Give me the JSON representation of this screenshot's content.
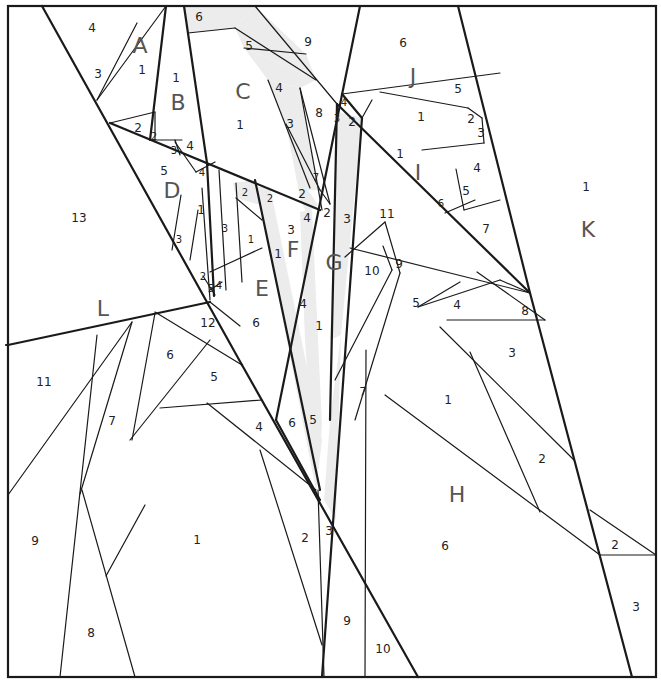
{
  "diagram": {
    "border": {
      "x": 8,
      "y": 6,
      "w": 648,
      "h": 671
    },
    "colors": {
      "line": "#1a1a1a",
      "shade": "#ececec",
      "label": "#222222",
      "section_label": "#555555"
    },
    "shaded_pieces": [
      {
        "id": "C6",
        "points": "184,6 255,6 235,28 188,33"
      },
      {
        "id": "C5",
        "points": "235,28 255,6 306,54 316,80 288,67 244,48"
      },
      {
        "id": "C4",
        "points": "244,48 288,67 316,80 300,88 268,80"
      },
      {
        "id": "C3",
        "points": "268,80 300,88 320,190 308,190 286,124"
      },
      {
        "id": "F2",
        "points": "286,124 308,190 318,205 307,214 300,198"
      },
      {
        "id": "G3",
        "points": "338,112 362,118 341,335 330,340"
      },
      {
        "id": "G4",
        "points": "300,212 312,210 322,425 316,490 305,340"
      },
      {
        "id": "F1",
        "points": "257,187 270,187 322,440 316,490"
      },
      {
        "id": "G3b",
        "points": "330,420 341,335 336,520 324,500"
      },
      {
        "id": "E2",
        "points": "233,183 255,180 264,206 236,198"
      }
    ],
    "bold_lines": [
      [
        42,
        6,
        242,
        365
      ],
      [
        242,
        365,
        418,
        677
      ],
      [
        110,
        123,
        320,
        210
      ],
      [
        184,
        6,
        207,
        163
      ],
      [
        166,
        6,
        150,
        140
      ],
      [
        360,
        6,
        276,
        420
      ],
      [
        276,
        420,
        320,
        500
      ],
      [
        458,
        6,
        530,
        293
      ],
      [
        530,
        293,
        632,
        677
      ],
      [
        337,
        104,
        530,
        293
      ],
      [
        342,
        94,
        362,
        118
      ],
      [
        362,
        118,
        322,
        677
      ],
      [
        337,
        104,
        330,
        420
      ],
      [
        207,
        163,
        214,
        296
      ],
      [
        255,
        180,
        320,
        490
      ],
      [
        8,
        345,
        210,
        302
      ],
      [
        6,
        345,
        8,
        345
      ]
    ],
    "thin_lines": [
      [
        97,
        100,
        166,
        6
      ],
      [
        97,
        100,
        137,
        23
      ],
      [
        110,
        123,
        155,
        112
      ],
      [
        155,
        112,
        155,
        140
      ],
      [
        150,
        140,
        182,
        140
      ],
      [
        175,
        140,
        180,
        155
      ],
      [
        188,
        33,
        235,
        28
      ],
      [
        235,
        28,
        316,
        80
      ],
      [
        244,
        48,
        306,
        54
      ],
      [
        255,
        6,
        337,
        104
      ],
      [
        268,
        80,
        310,
        188
      ],
      [
        286,
        124,
        320,
        190
      ],
      [
        300,
        88,
        330,
        204
      ],
      [
        300,
        88,
        322,
        210
      ],
      [
        320,
        190,
        330,
        204
      ],
      [
        342,
        94,
        500,
        73
      ],
      [
        380,
        92,
        468,
        108
      ],
      [
        468,
        108,
        482,
        118
      ],
      [
        482,
        118,
        484,
        143
      ],
      [
        422,
        150,
        484,
        143
      ],
      [
        362,
        118,
        372,
        100
      ],
      [
        456,
        169,
        464,
        210
      ],
      [
        464,
        210,
        500,
        200
      ],
      [
        445,
        213,
        475,
        200
      ],
      [
        350,
        248,
        530,
        293
      ],
      [
        345,
        257,
        385,
        222
      ],
      [
        392,
        270,
        383,
        246
      ],
      [
        400,
        273,
        385,
        222
      ],
      [
        392,
        270,
        335,
        380
      ],
      [
        400,
        273,
        355,
        420
      ],
      [
        460,
        282,
        418,
        307
      ],
      [
        418,
        307,
        500,
        280
      ],
      [
        500,
        280,
        530,
        293
      ],
      [
        477,
        272,
        545,
        320
      ],
      [
        447,
        320,
        545,
        320
      ],
      [
        440,
        327,
        574,
        460
      ],
      [
        470,
        352,
        540,
        512
      ],
      [
        385,
        395,
        600,
        555
      ],
      [
        590,
        510,
        656,
        555
      ],
      [
        600,
        555,
        656,
        555
      ],
      [
        366,
        350,
        365,
        677
      ],
      [
        202,
        188,
        210,
        300
      ],
      [
        198,
        210,
        190,
        260
      ],
      [
        219,
        170,
        226,
        290
      ],
      [
        236,
        183,
        242,
        282
      ],
      [
        236,
        198,
        262,
        220
      ],
      [
        210,
        272,
        262,
        248
      ],
      [
        203,
        276,
        215,
        295
      ],
      [
        210,
        290,
        222,
        282
      ],
      [
        196,
        172,
        215,
        162
      ],
      [
        175,
        142,
        196,
        172
      ],
      [
        181,
        195,
        172,
        250
      ],
      [
        210,
        302,
        240,
        326
      ],
      [
        155,
        312,
        242,
        365
      ],
      [
        130,
        440,
        210,
        340
      ],
      [
        132,
        322,
        80,
        494
      ],
      [
        8,
        495,
        132,
        322
      ],
      [
        155,
        313,
        132,
        440
      ],
      [
        160,
        408,
        262,
        400
      ],
      [
        207,
        403,
        316,
        490
      ],
      [
        97,
        335,
        60,
        677
      ],
      [
        82,
        490,
        135,
        677
      ],
      [
        106,
        576,
        145,
        505
      ],
      [
        260,
        450,
        322,
        645
      ],
      [
        318,
        490,
        324,
        677
      ]
    ],
    "section_labels": [
      {
        "text": "A",
        "x": 140,
        "y": 45
      },
      {
        "text": "B",
        "x": 178,
        "y": 102
      },
      {
        "text": "C",
        "x": 243,
        "y": 91
      },
      {
        "text": "D",
        "x": 172,
        "y": 190
      },
      {
        "text": "E",
        "x": 262,
        "y": 288
      },
      {
        "text": "F",
        "x": 293,
        "y": 249
      },
      {
        "text": "G",
        "x": 334,
        "y": 262
      },
      {
        "text": "H",
        "x": 457,
        "y": 494
      },
      {
        "text": "I",
        "x": 418,
        "y": 172
      },
      {
        "text": "J",
        "x": 413,
        "y": 76
      },
      {
        "text": "K",
        "x": 588,
        "y": 229
      },
      {
        "text": "L",
        "x": 103,
        "y": 308
      }
    ],
    "piece_numbers": [
      {
        "text": "4",
        "x": 92,
        "y": 28
      },
      {
        "text": "3",
        "x": 98,
        "y": 74
      },
      {
        "text": "1",
        "x": 142,
        "y": 70
      },
      {
        "text": "1",
        "x": 176,
        "y": 78
      },
      {
        "text": "2",
        "x": 138,
        "y": 128
      },
      {
        "text": "2",
        "x": 154,
        "y": 136,
        "small": true
      },
      {
        "text": "3",
        "x": 174,
        "y": 150,
        "small": true
      },
      {
        "text": "4",
        "x": 190,
        "y": 146
      },
      {
        "text": "6",
        "x": 199,
        "y": 17
      },
      {
        "text": "5",
        "x": 249,
        "y": 46
      },
      {
        "text": "9",
        "x": 308,
        "y": 42
      },
      {
        "text": "4",
        "x": 279,
        "y": 88
      },
      {
        "text": "1",
        "x": 240,
        "y": 125
      },
      {
        "text": "3",
        "x": 290,
        "y": 124
      },
      {
        "text": "8",
        "x": 319,
        "y": 113
      },
      {
        "text": "7",
        "x": 316,
        "y": 177,
        "small": true
      },
      {
        "text": "2",
        "x": 302,
        "y": 194
      },
      {
        "text": "4",
        "x": 307,
        "y": 218
      },
      {
        "text": "2",
        "x": 327,
        "y": 213
      },
      {
        "text": "3",
        "x": 347,
        "y": 219
      },
      {
        "text": "4",
        "x": 344,
        "y": 102,
        "small": true
      },
      {
        "text": "3",
        "x": 337,
        "y": 118,
        "small": true
      },
      {
        "text": "2",
        "x": 352,
        "y": 122
      },
      {
        "text": "6",
        "x": 403,
        "y": 43
      },
      {
        "text": "5",
        "x": 458,
        "y": 89
      },
      {
        "text": "1",
        "x": 421,
        "y": 117
      },
      {
        "text": "2",
        "x": 471,
        "y": 119
      },
      {
        "text": "3",
        "x": 481,
        "y": 133
      },
      {
        "text": "1",
        "x": 400,
        "y": 154
      },
      {
        "text": "4",
        "x": 477,
        "y": 168
      },
      {
        "text": "5",
        "x": 466,
        "y": 191
      },
      {
        "text": "6",
        "x": 441,
        "y": 203,
        "small": true
      },
      {
        "text": "11",
        "x": 387,
        "y": 214
      },
      {
        "text": "7",
        "x": 486,
        "y": 229
      },
      {
        "text": "1",
        "x": 586,
        "y": 187
      },
      {
        "text": "13",
        "x": 79,
        "y": 218
      },
      {
        "text": "5",
        "x": 164,
        "y": 171
      },
      {
        "text": "4",
        "x": 202,
        "y": 172,
        "small": true
      },
      {
        "text": "1",
        "x": 201,
        "y": 210
      },
      {
        "text": "3",
        "x": 179,
        "y": 239,
        "small": true
      },
      {
        "text": "2",
        "x": 245,
        "y": 192,
        "small": true
      },
      {
        "text": "2",
        "x": 270,
        "y": 198,
        "small": true
      },
      {
        "text": "3",
        "x": 225,
        "y": 228,
        "small": true
      },
      {
        "text": "1",
        "x": 251,
        "y": 239,
        "small": true
      },
      {
        "text": "1",
        "x": 278,
        "y": 254
      },
      {
        "text": "3",
        "x": 291,
        "y": 230
      },
      {
        "text": "2",
        "x": 203,
        "y": 276,
        "small": true
      },
      {
        "text": "5",
        "x": 211,
        "y": 288,
        "small": true
      },
      {
        "text": "4",
        "x": 219,
        "y": 285,
        "small": true
      },
      {
        "text": "10",
        "x": 372,
        "y": 271
      },
      {
        "text": "9",
        "x": 399,
        "y": 264
      },
      {
        "text": "5",
        "x": 416,
        "y": 303
      },
      {
        "text": "4",
        "x": 457,
        "y": 305
      },
      {
        "text": "8",
        "x": 525,
        "y": 311
      },
      {
        "text": "3",
        "x": 512,
        "y": 353
      },
      {
        "text": "1",
        "x": 448,
        "y": 400
      },
      {
        "text": "2",
        "x": 542,
        "y": 459
      },
      {
        "text": "6",
        "x": 445,
        "y": 546
      },
      {
        "text": "2",
        "x": 615,
        "y": 545
      },
      {
        "text": "3",
        "x": 636,
        "y": 607
      },
      {
        "text": "7",
        "x": 363,
        "y": 392
      },
      {
        "text": "4",
        "x": 303,
        "y": 304
      },
      {
        "text": "1",
        "x": 319,
        "y": 326
      },
      {
        "text": "6",
        "x": 256,
        "y": 323
      },
      {
        "text": "12",
        "x": 208,
        "y": 323
      },
      {
        "text": "6",
        "x": 170,
        "y": 355
      },
      {
        "text": "5",
        "x": 214,
        "y": 377
      },
      {
        "text": "4",
        "x": 259,
        "y": 427
      },
      {
        "text": "6",
        "x": 292,
        "y": 423
      },
      {
        "text": "5",
        "x": 313,
        "y": 420
      },
      {
        "text": "11",
        "x": 44,
        "y": 382
      },
      {
        "text": "7",
        "x": 112,
        "y": 421
      },
      {
        "text": "9",
        "x": 35,
        "y": 541
      },
      {
        "text": "1",
        "x": 197,
        "y": 540
      },
      {
        "text": "2",
        "x": 305,
        "y": 538
      },
      {
        "text": "3",
        "x": 329,
        "y": 531
      },
      {
        "text": "8",
        "x": 91,
        "y": 633
      },
      {
        "text": "9",
        "x": 347,
        "y": 621
      },
      {
        "text": "10",
        "x": 383,
        "y": 649
      }
    ]
  }
}
